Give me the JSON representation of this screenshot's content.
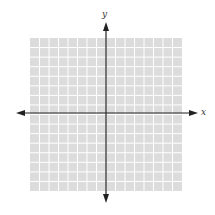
{
  "diagram": {
    "type": "coordinate-plane",
    "axes": {
      "x_label": "x",
      "y_label": "y"
    },
    "grid": {
      "columns": 16,
      "rows": 16,
      "background_color": "#dcdcdc",
      "line_color": "#ffffff"
    },
    "axis_color": "#222222"
  }
}
